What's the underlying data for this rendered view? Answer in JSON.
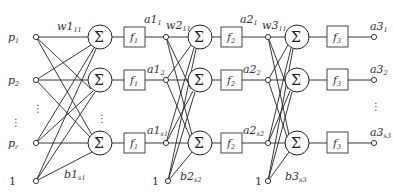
{
  "diagram": {
    "type": "three-layer-feedforward-neural-network",
    "inputs": [
      {
        "label": "p",
        "sub": "1"
      },
      {
        "label": "p",
        "sub": "2"
      },
      {
        "label": "p",
        "sub": "r"
      }
    ],
    "bias_input_label": "1",
    "ellipsis": "⋮",
    "sum_symbol": "Σ",
    "layers": [
      {
        "weight_label": {
          "label": "w1",
          "sub": "11"
        },
        "bias_label": {
          "label": "b1",
          "sub": "s1"
        },
        "transfer": {
          "label": "f",
          "sub": "1"
        },
        "outputs": [
          {
            "label": "a1",
            "sub": "1"
          },
          {
            "label": "a1",
            "sub": "2"
          },
          {
            "label": "a1",
            "sub": "s1"
          }
        ]
      },
      {
        "weight_label": {
          "label": "w2",
          "sub": "11"
        },
        "bias_label": {
          "label": "b2",
          "sub": "s2"
        },
        "transfer": {
          "label": "f",
          "sub": "2"
        },
        "outputs": [
          {
            "label": "a2",
            "sub": "1"
          },
          {
            "label": "a2",
            "sub": "2"
          },
          {
            "label": "a2",
            "sub": "s2"
          }
        ]
      },
      {
        "weight_label": {
          "label": "w3",
          "sub": "11"
        },
        "bias_label": {
          "label": "b3",
          "sub": "s3"
        },
        "transfer": {
          "label": "f",
          "sub": "3"
        },
        "outputs": [
          {
            "label": "a3",
            "sub": "1"
          },
          {
            "label": "a3",
            "sub": "2"
          },
          {
            "label": "a3",
            "sub": "s3"
          }
        ]
      }
    ]
  }
}
